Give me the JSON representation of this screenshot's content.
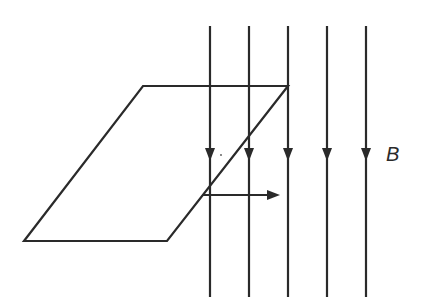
{
  "diagram": {
    "field": {
      "label": "B",
      "direction": "downward",
      "line_count": 5,
      "line_x": [
        210,
        249,
        288,
        327,
        366
      ],
      "line_top": 26,
      "line_bottom": 297,
      "arrow_y": 155
    },
    "loop": {
      "shape": "parallelogram (rectangle in perspective)",
      "points": [
        [
          143,
          86
        ],
        [
          288,
          86
        ],
        [
          167,
          241
        ],
        [
          24,
          241
        ]
      ]
    },
    "velocity": {
      "direction": "right",
      "start": [
        203,
        195
      ],
      "end": [
        279,
        195
      ]
    },
    "colors": {
      "stroke": "#2a2a2a",
      "background": "#ffffff"
    }
  }
}
